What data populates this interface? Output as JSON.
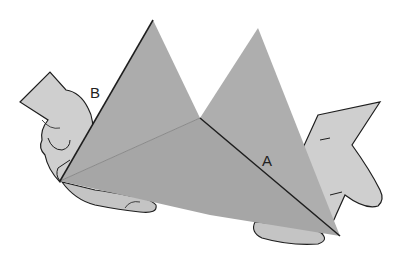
{
  "figure": {
    "labels": {
      "a": "A",
      "b": "B"
    },
    "colors": {
      "paper": "#a9a9a9",
      "paper_light": "#b4b4b4",
      "hand": "#cfcfcf",
      "outline": "#1e1e1e",
      "background": "#ffffff"
    }
  }
}
